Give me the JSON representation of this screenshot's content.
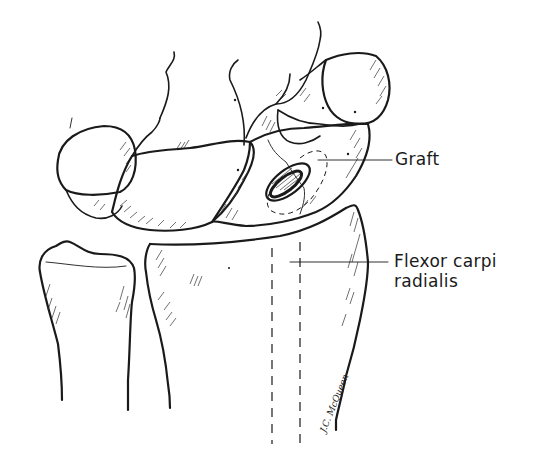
{
  "figure": {
    "type": "anatomical line illustration",
    "labels": {
      "graft": "Graft",
      "flexor_line1": "Flexor carpi",
      "flexor_line2": "radialis"
    },
    "signature": "J.C. McQueen",
    "colors": {
      "ink": "#1a1a1a",
      "background": "#ffffff"
    }
  }
}
